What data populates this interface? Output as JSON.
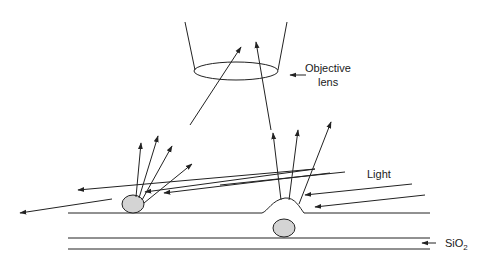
{
  "diagram": {
    "labels": {
      "objective_line1": "Objective",
      "objective_line2": "lens",
      "light": "Light",
      "sio2_main": "SiO",
      "sio2_sub": "2"
    },
    "colors": {
      "line": "#222222",
      "particle_fill": "#d4d4d4",
      "background": "#ffffff"
    }
  }
}
